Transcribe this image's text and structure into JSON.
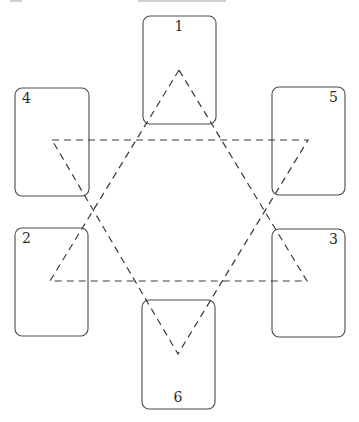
{
  "diagram": {
    "type": "spread-layout",
    "cards": [
      {
        "id": "1",
        "label": "1",
        "x": 143,
        "y": 16,
        "w": 73,
        "h": 108,
        "label_x": 179,
        "label_y": 31,
        "anchor": "middle"
      },
      {
        "id": "4",
        "label": "4",
        "x": 15,
        "y": 88,
        "w": 74,
        "h": 108,
        "label_x": 22,
        "label_y": 103,
        "anchor": "start"
      },
      {
        "id": "5",
        "label": "5",
        "x": 272,
        "y": 87,
        "w": 73,
        "h": 108,
        "label_x": 338,
        "label_y": 102,
        "anchor": "end"
      },
      {
        "id": "2",
        "label": "2",
        "x": 15,
        "y": 228,
        "w": 73,
        "h": 108,
        "label_x": 22,
        "label_y": 243,
        "anchor": "start"
      },
      {
        "id": "3",
        "label": "3",
        "x": 272,
        "y": 229,
        "w": 73,
        "h": 108,
        "label_x": 338,
        "label_y": 244,
        "anchor": "end"
      },
      {
        "id": "6",
        "label": "6",
        "x": 142,
        "y": 300,
        "w": 73,
        "h": 109,
        "label_x": 178,
        "label_y": 402,
        "anchor": "middle"
      }
    ],
    "triangles": [
      {
        "name": "upward-triangle",
        "points": "179,70 50,281 307,281"
      },
      {
        "name": "downward-triangle",
        "points": "52,140 308,140 178,354"
      }
    ],
    "colors": {
      "stroke": "#4a4a4a",
      "dash": "#3a3a3a",
      "background": "#ffffff"
    }
  }
}
